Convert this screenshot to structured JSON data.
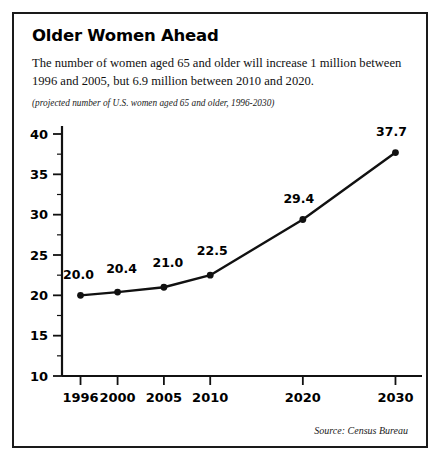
{
  "panel": {
    "title": "Older Women Ahead",
    "description": "The number of women aged 65 and older will increase 1 million between 1996 and 2005, but 6.9 million between 2010 and 2020.",
    "subtitle": "(projected number of U.S. women aged 65 and older, 1996-2030)",
    "source": "Source: Census Bureau",
    "border_color": "#1a1a1a",
    "background_color": "#ffffff"
  },
  "chart_data": {
    "type": "line",
    "title": "Older Women Ahead",
    "subtitle": "(projected number of U.S. women aged 65 and older, 1996-2030)",
    "xlabel": "",
    "ylabel": "",
    "categories": [
      "1996",
      "2000",
      "2005",
      "2010",
      "2020",
      "2030"
    ],
    "x": [
      1996,
      2000,
      2005,
      2010,
      2020,
      2030
    ],
    "values": [
      20.0,
      20.4,
      21.0,
      22.5,
      29.4,
      37.7
    ],
    "point_labels": [
      "20.0",
      "20.4",
      "21.0",
      "22.5",
      "29.4",
      "37.7"
    ],
    "ylim": [
      10,
      40
    ],
    "xlim": [
      1994,
      2032
    ],
    "ytick_labels": [
      "40",
      "35",
      "30",
      "25",
      "20",
      "15",
      "10"
    ],
    "yticks": [
      40,
      35,
      30,
      25,
      20,
      15,
      10
    ],
    "yminor_ticks": [
      37.5,
      32.5,
      27.5,
      22.5,
      17.5,
      12.5
    ],
    "xtick_labels": [
      "1996",
      "2000",
      "2005",
      "2010",
      "2020",
      "2030"
    ],
    "grid": false,
    "legend": false,
    "series_color": "#111111",
    "marker": "circle",
    "source": "Source: Census Bureau"
  }
}
